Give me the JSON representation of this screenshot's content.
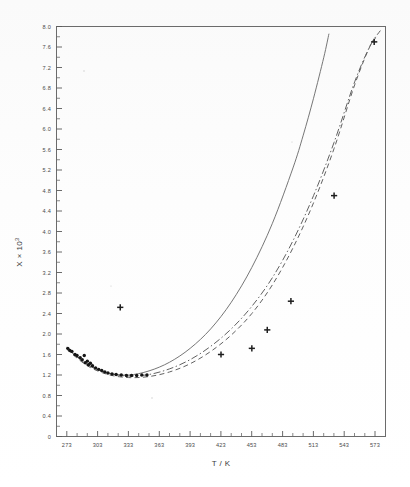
{
  "figure": {
    "kind": "scanned-scientific-plot",
    "background_color": "#ffffff",
    "ink_color": "#2b2b2b"
  },
  "axes": {
    "x_title": "T / K",
    "y_title": "X × 10",
    "y_title_exponent": "3",
    "x_ticklabels": [
      "273",
      "303",
      "333",
      "363",
      "393",
      "423",
      "453",
      "483",
      "513",
      "543",
      "573"
    ],
    "y_ticklabels": [
      "0",
      "0.4",
      "0.8",
      "1.2",
      "1.6",
      "2.0",
      "2.4",
      "2.8",
      "3.2",
      "3.6",
      "4.0",
      "4.4",
      "4.8",
      "5.2",
      "5.6",
      "6.0",
      "6.4",
      "6.8",
      "7.2",
      "7.6",
      "8.0"
    ]
  },
  "chart_data": {
    "type": "line",
    "title": "",
    "xlabel": "T / K",
    "ylabel": "X × 10³",
    "xlim": [
      263,
      583
    ],
    "ylim": [
      0,
      8.0
    ],
    "x_ticks": [
      273,
      303,
      333,
      363,
      393,
      423,
      453,
      483,
      513,
      543,
      573
    ],
    "y_ticks": [
      0,
      0.4,
      0.8,
      1.2,
      1.6,
      2.0,
      2.4,
      2.8,
      3.2,
      3.6,
      4.0,
      4.4,
      4.8,
      5.2,
      5.6,
      6.0,
      6.4,
      6.8,
      7.2,
      7.6,
      8.0
    ],
    "x_minor_step": 10,
    "y_minor_step": 0.2,
    "grid": false,
    "legend": "none",
    "series": [
      {
        "name": "model-curve-solid",
        "style": "solid",
        "x": [
          273,
          293,
          313,
          333,
          353,
          373,
          393,
          413,
          433,
          453,
          473,
          493,
          503,
          513,
          523,
          528
        ],
        "y": [
          1.72,
          1.4,
          1.24,
          1.2,
          1.28,
          1.45,
          1.72,
          2.1,
          2.62,
          3.3,
          4.16,
          5.24,
          5.88,
          6.6,
          7.4,
          7.86
        ]
      },
      {
        "name": "model-curve-dashed",
        "style": "dashed",
        "x": [
          273,
          293,
          313,
          333,
          353,
          373,
          393,
          413,
          433,
          453,
          473,
          493,
          513,
          533,
          553,
          568,
          575
        ],
        "y": [
          1.7,
          1.38,
          1.21,
          1.15,
          1.17,
          1.26,
          1.42,
          1.66,
          1.98,
          2.4,
          2.96,
          3.68,
          4.56,
          5.62,
          6.86,
          7.62,
          7.8
        ]
      },
      {
        "name": "model-curve-dash-dot",
        "style": "dash-dot",
        "x": [
          273,
          293,
          313,
          333,
          353,
          373,
          393,
          413,
          433,
          453,
          473,
          493,
          513,
          533,
          553,
          568,
          578
        ],
        "y": [
          1.74,
          1.41,
          1.24,
          1.18,
          1.21,
          1.32,
          1.5,
          1.76,
          2.1,
          2.54,
          3.1,
          3.82,
          4.7,
          5.74,
          6.92,
          7.62,
          7.92
        ]
      }
    ],
    "scatter": [
      {
        "name": "low-temperature-data-dots",
        "marker": "filled-circle",
        "points": [
          {
            "x": 274,
            "y": 1.72
          },
          {
            "x": 276,
            "y": 1.68
          },
          {
            "x": 278,
            "y": 1.66
          },
          {
            "x": 281,
            "y": 1.6
          },
          {
            "x": 283,
            "y": 1.58
          },
          {
            "x": 286,
            "y": 1.54
          },
          {
            "x": 288,
            "y": 1.5
          },
          {
            "x": 290,
            "y": 1.58
          },
          {
            "x": 291,
            "y": 1.44
          },
          {
            "x": 293,
            "y": 1.47
          },
          {
            "x": 294,
            "y": 1.4
          },
          {
            "x": 296,
            "y": 1.43
          },
          {
            "x": 298,
            "y": 1.38
          },
          {
            "x": 301,
            "y": 1.34
          },
          {
            "x": 304,
            "y": 1.31
          },
          {
            "x": 307,
            "y": 1.29
          },
          {
            "x": 310,
            "y": 1.26
          },
          {
            "x": 313,
            "y": 1.24
          },
          {
            "x": 317,
            "y": 1.22
          },
          {
            "x": 321,
            "y": 1.21
          },
          {
            "x": 326,
            "y": 1.2
          },
          {
            "x": 331,
            "y": 1.19
          },
          {
            "x": 336,
            "y": 1.19
          },
          {
            "x": 341,
            "y": 1.19
          },
          {
            "x": 346,
            "y": 1.2
          },
          {
            "x": 351,
            "y": 1.2
          }
        ]
      },
      {
        "name": "experimental-plus-markers",
        "marker": "plus",
        "points": [
          {
            "x": 325,
            "y": 2.52
          },
          {
            "x": 423,
            "y": 1.6
          },
          {
            "x": 453,
            "y": 1.72
          },
          {
            "x": 468,
            "y": 2.08
          },
          {
            "x": 491,
            "y": 2.64
          },
          {
            "x": 533,
            "y": 4.7
          },
          {
            "x": 572,
            "y": 7.7
          }
        ]
      }
    ]
  }
}
